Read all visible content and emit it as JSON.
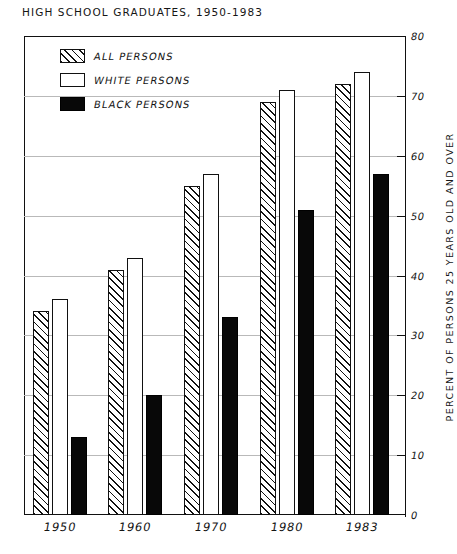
{
  "chart_data": {
    "type": "bar",
    "title": "HIGH SCHOOL GRADUATES, 1950-1983",
    "xlabel": "",
    "ylabel": "PERCENT OF PERSONS 25 YEARS OLD AND OVER",
    "categories": [
      "1950",
      "1960",
      "1970",
      "1980",
      "1983"
    ],
    "series": [
      {
        "name": "ALL PERSONS",
        "values": [
          34,
          41,
          55,
          69,
          72
        ]
      },
      {
        "name": "WHITE PERSONS",
        "values": [
          36,
          43,
          57,
          71,
          74
        ]
      },
      {
        "name": "BLACK PERSONS",
        "values": [
          13,
          20,
          33,
          51,
          57
        ]
      }
    ],
    "ylim": [
      0,
      80
    ],
    "yticks": [
      0,
      10,
      20,
      30,
      40,
      50,
      60,
      70,
      80
    ],
    "ytick_labels": [
      "0",
      "10",
      "20",
      "30",
      "40",
      "50",
      "60",
      "70",
      "80"
    ],
    "grid": true,
    "grid_axis": "y",
    "legend_position": "upper-left-inside",
    "colors": {
      "all_persons": "#ffffff-hatched",
      "white_persons": "#ffffff",
      "black_persons": "#080808",
      "axis": "#111111",
      "gridline": "#b9b9b9"
    }
  },
  "legend": {
    "items": [
      {
        "label": "ALL PERSONS",
        "swatch": "hatched-swatch"
      },
      {
        "label": "WHITE PERSONS",
        "swatch": "white-swatch"
      },
      {
        "label": "BLACK PERSONS",
        "swatch": "black-swatch"
      }
    ]
  }
}
